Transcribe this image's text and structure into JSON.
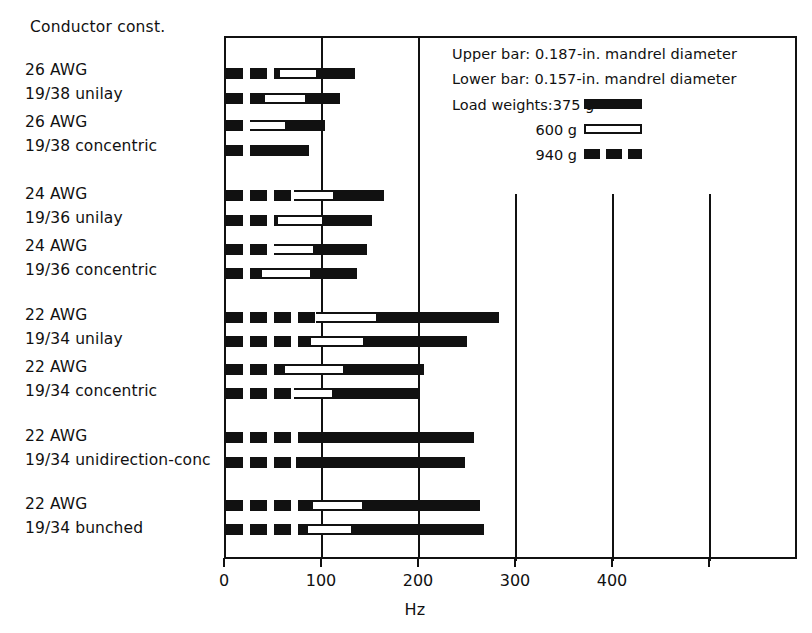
{
  "figure": {
    "category_header": "Conductor const.",
    "x_axis_title": "Hz"
  },
  "legend": {
    "upper_bar_note": "Upper bar: 0.187-in. mandrel diameter",
    "lower_bar_note": "Lower bar: 0.157-in. mandrel diameter",
    "load_weights_label": "Load weights:",
    "entries": [
      {
        "label": "375 g",
        "style": "solid"
      },
      {
        "label": "600 g",
        "style": "open"
      },
      {
        "label": "940 g",
        "style": "dashed"
      }
    ]
  },
  "axis": {
    "ticks": [
      {
        "value": 0,
        "label": "0"
      },
      {
        "value": 100,
        "label": "100"
      },
      {
        "value": 200,
        "label": "200"
      },
      {
        "value": 300,
        "label": "300"
      },
      {
        "value": 400,
        "label": "400"
      },
      {
        "value": 500,
        "label": ""
      }
    ]
  },
  "chart_data": {
    "type": "bar",
    "orientation": "horizontal",
    "title": "",
    "xlabel": "Hz",
    "ylabel": "Conductor const.",
    "xlim": [
      0,
      590
    ],
    "grid": true,
    "legend_position": "top-right",
    "stacking": "overlaid-cumulative",
    "series": [
      {
        "name": "375 g",
        "style": "solid"
      },
      {
        "name": "600 g",
        "style": "open"
      },
      {
        "name": "940 g",
        "style": "dashed"
      }
    ],
    "categories": [
      "26 AWG 19/38 unilay",
      "26 AWG 19/38 concentric",
      "24 AWG 19/36 unilay",
      "24 AWG 19/36 concentric",
      "22 AWG 19/34 unilay",
      "22 AWG 19/34 concentric",
      "22 AWG 19/34 unidirection-conc",
      "22 AWG 19/34 bunched"
    ],
    "rows": [
      {
        "category": "26 AWG 19/38 unilay",
        "bar": "upper",
        "mandrel_in": 0.187,
        "v940": 56,
        "v600": 95,
        "v375": 133
      },
      {
        "category": "26 AWG 19/38 unilay",
        "bar": "lower",
        "mandrel_in": 0.157,
        "v940": 40,
        "v600": 83,
        "v375": 118
      },
      {
        "category": "26 AWG 19/38 concentric",
        "bar": "upper",
        "mandrel_in": 0.187,
        "v940": 25,
        "v600": 63,
        "v375": 102
      },
      {
        "category": "26 AWG 19/38 concentric",
        "bar": "lower",
        "mandrel_in": 0.157,
        "v940": 25,
        "v600": 25,
        "v375": 86
      },
      {
        "category": "24 AWG 19/36 unilay",
        "bar": "upper",
        "mandrel_in": 0.187,
        "v940": 70,
        "v600": 112,
        "v375": 163
      },
      {
        "category": "24 AWG 19/36 unilay",
        "bar": "lower",
        "mandrel_in": 0.157,
        "v940": 54,
        "v600": 101,
        "v375": 150
      },
      {
        "category": "24 AWG 19/36 concentric",
        "bar": "upper",
        "mandrel_in": 0.187,
        "v940": 49,
        "v600": 92,
        "v375": 145
      },
      {
        "category": "24 AWG 19/36 concentric",
        "bar": "lower",
        "mandrel_in": 0.157,
        "v940": 37,
        "v600": 89,
        "v375": 135
      },
      {
        "category": "22 AWG 19/34 unilay",
        "bar": "upper",
        "mandrel_in": 0.187,
        "v940": 93,
        "v600": 157,
        "v375": 281
      },
      {
        "category": "22 AWG 19/34 unilay",
        "bar": "lower",
        "mandrel_in": 0.157,
        "v940": 88,
        "v600": 143,
        "v375": 248
      },
      {
        "category": "22 AWG 19/34 concentric",
        "bar": "upper",
        "mandrel_in": 0.187,
        "v940": 61,
        "v600": 123,
        "v375": 204
      },
      {
        "category": "22 AWG 19/34 concentric",
        "bar": "lower",
        "mandrel_in": 0.157,
        "v940": 70,
        "v600": 111,
        "v375": 199
      },
      {
        "category": "22 AWG 19/34 unidirection-conc",
        "bar": "upper",
        "mandrel_in": 0.187,
        "v940": 81,
        "v600": 81,
        "v375": 256
      },
      {
        "category": "22 AWG 19/34 unidirection-conc",
        "bar": "lower",
        "mandrel_in": 0.157,
        "v940": 72,
        "v600": 72,
        "v375": 246
      },
      {
        "category": "22 AWG 19/34 bunched",
        "bar": "upper",
        "mandrel_in": 0.187,
        "v940": 90,
        "v600": 142,
        "v375": 262
      },
      {
        "category": "22 AWG 19/34 bunched",
        "bar": "lower",
        "mandrel_in": 0.157,
        "v940": 85,
        "v600": 131,
        "v375": 266
      }
    ]
  },
  "category_labels": [
    {
      "l1": "26 AWG",
      "l2": "19/38 unilay",
      "top": 58
    },
    {
      "l1": "26 AWG",
      "l2": "19/38 concentric",
      "top": 110
    },
    {
      "l1": "24 AWG",
      "l2": "19/36 unilay",
      "top": 182
    },
    {
      "l1": "24 AWG",
      "l2": "19/36 concentric",
      "top": 234
    },
    {
      "l1": "22 AWG",
      "l2": "19/34 unilay",
      "top": 303
    },
    {
      "l1": "22 AWG",
      "l2": "19/34 concentric",
      "top": 355
    },
    {
      "l1": "22 AWG",
      "l2": "19/34 unidirection-conc",
      "top": 424
    },
    {
      "l1": "22 AWG",
      "l2": "19/34 bunched",
      "top": 492
    }
  ],
  "layout": {
    "row_y": [
      71,
      96,
      123,
      148,
      193,
      218,
      247,
      271,
      315,
      339,
      367,
      391,
      435,
      460,
      503,
      527
    ],
    "plot_left": 224,
    "plot_top": 36,
    "plot_width": 573,
    "plot_height": 523,
    "px_per_hz": 0.97
  },
  "colors": {
    "ink": "#111111",
    "paper": "#ffffff"
  }
}
